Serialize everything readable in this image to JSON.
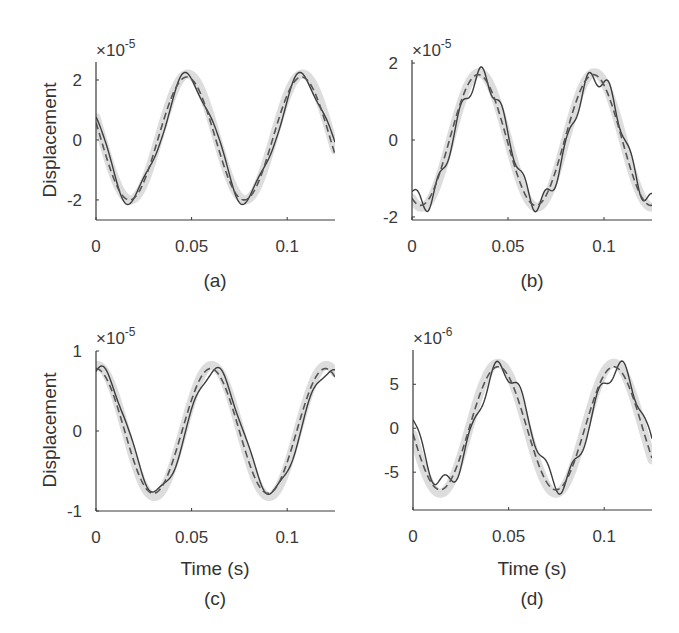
{
  "figure": {
    "colors": {
      "reference_band": "#d9d9d9",
      "solid_line": "#3c3c3c",
      "dashed_line": "#555555",
      "axis": "#3a3a3a",
      "text": "#333333"
    }
  },
  "chart_data": [
    {
      "id": "a",
      "type": "line",
      "caption": "(a)",
      "ylabel": "Displacement",
      "xlabel": "",
      "exponent_label": "×10",
      "exponent": "-5",
      "xlim": [
        0,
        0.125
      ],
      "ylim": [
        -2.67,
        2.6
      ],
      "xticks": [
        0,
        0.05,
        0.1
      ],
      "xtick_labels": [
        "0",
        "0.05",
        "0.1"
      ],
      "yticks": [
        2,
        0,
        -2
      ],
      "ytick_labels": [
        "2",
        "0",
        "-2"
      ],
      "series": [
        {
          "name": "reference",
          "style": "band",
          "model": {
            "amplitude": 2.1,
            "period": 0.06,
            "peak_time": 0.048,
            "offset": 0.1
          }
        },
        {
          "name": "response",
          "style": "solid",
          "model": {
            "amplitude": 2.0,
            "period": 0.06,
            "peak_time": 0.0485,
            "offset": 0.05,
            "ripple_amplitude": 0.28,
            "ripple_freq": 50
          }
        },
        {
          "name": "estimate",
          "style": "dashed",
          "model": {
            "amplitude": 2.05,
            "period": 0.06,
            "peak_time": 0.0475,
            "offset": 0.05
          }
        }
      ]
    },
    {
      "id": "b",
      "type": "line",
      "caption": "(b)",
      "ylabel": "",
      "xlabel": "",
      "exponent_label": "×10",
      "exponent": "-5",
      "xlim": [
        0,
        0.125
      ],
      "ylim": [
        -2.08,
        2.08
      ],
      "xticks": [
        0,
        0.05,
        0.1
      ],
      "xtick_labels": [
        "0",
        "0.05",
        "0.1"
      ],
      "yticks": [
        2,
        0,
        -2
      ],
      "ytick_labels": [
        "2",
        "0",
        "-2"
      ],
      "series": [
        {
          "name": "reference",
          "style": "band",
          "model": {
            "amplitude": 1.75,
            "period": 0.06,
            "peak_time": 0.035,
            "offset": 0.0
          }
        },
        {
          "name": "response",
          "style": "solid",
          "model": {
            "amplitude": 1.65,
            "period": 0.06,
            "peak_time": 0.036,
            "offset": 0.0,
            "ripple_amplitude": 0.25,
            "ripple_freq": 90
          }
        },
        {
          "name": "estimate",
          "style": "dashed",
          "model": {
            "amplitude": 1.7,
            "period": 0.06,
            "peak_time": 0.0345,
            "offset": 0.0
          }
        }
      ]
    },
    {
      "id": "c",
      "type": "line",
      "caption": "(c)",
      "ylabel": "Displacement",
      "xlabel": "Time (s)",
      "exponent_label": "×10",
      "exponent": "-5",
      "xlim": [
        0,
        0.125
      ],
      "ylim": [
        -1,
        1
      ],
      "xticks": [
        0,
        0.05,
        0.1
      ],
      "xtick_labels": [
        "0",
        "0.05",
        "0.1"
      ],
      "yticks": [
        1,
        0,
        -1
      ],
      "ytick_labels": [
        "1",
        "0",
        "-1"
      ],
      "series": [
        {
          "name": "reference",
          "style": "band",
          "model": {
            "amplitude": 0.82,
            "period": 0.06,
            "peak_time": 0.0005,
            "offset": 0.0
          }
        },
        {
          "name": "response",
          "style": "solid",
          "model": {
            "amplitude": 0.76,
            "period": 0.06,
            "peak_time": 0.002,
            "offset": 0.0,
            "ripple_amplitude": 0.06,
            "ripple_freq": 65
          }
        },
        {
          "name": "estimate",
          "style": "dashed",
          "model": {
            "amplitude": 0.78,
            "period": 0.06,
            "peak_time": 0.0,
            "offset": 0.0
          }
        }
      ]
    },
    {
      "id": "d",
      "type": "line",
      "caption": "(d)",
      "ylabel": "",
      "xlabel": "Time (s)",
      "exponent_label": "×10",
      "exponent": "-6",
      "xlim": [
        0,
        0.125
      ],
      "ylim": [
        -9.3,
        8.9
      ],
      "xticks": [
        0,
        0.05,
        0.1
      ],
      "xtick_labels": [
        "0",
        "0.05",
        "0.1"
      ],
      "yticks": [
        5,
        0,
        -5
      ],
      "ytick_labels": [
        "5",
        "0",
        "-5"
      ],
      "series": [
        {
          "name": "reference",
          "style": "band",
          "model": {
            "amplitude": 7.4,
            "period": 0.0605,
            "peak_time": 0.0445,
            "offset": 0.0
          }
        },
        {
          "name": "response",
          "style": "solid",
          "model": {
            "amplitude": 6.6,
            "period": 0.0605,
            "peak_time": 0.0465,
            "offset": 0.2,
            "ripple_amplitude": 1.1,
            "ripple_freq": 75
          }
        },
        {
          "name": "estimate",
          "style": "dashed",
          "model": {
            "amplitude": 7.0,
            "period": 0.0605,
            "peak_time": 0.0445,
            "offset": 0.0
          }
        }
      ]
    }
  ]
}
